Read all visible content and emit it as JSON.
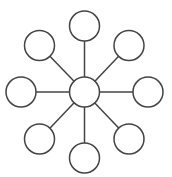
{
  "diagram": {
    "type": "hub-and-spoke",
    "stroke_color": "#444444",
    "fill_color": "#ffffff",
    "hub": {
      "id": "hub",
      "cx": 84.5,
      "cy": 92,
      "r": 15
    },
    "nodes": [
      {
        "id": "node-top",
        "cx": 84.5,
        "cy": 26,
        "r": 15
      },
      {
        "id": "node-top-right",
        "cx": 129,
        "cy": 45.5,
        "r": 15
      },
      {
        "id": "node-right",
        "cx": 148,
        "cy": 92,
        "r": 15
      },
      {
        "id": "node-bottom-right",
        "cx": 129,
        "cy": 139,
        "r": 15
      },
      {
        "id": "node-bottom",
        "cx": 84.5,
        "cy": 158,
        "r": 15
      },
      {
        "id": "node-bottom-left",
        "cx": 39.5,
        "cy": 139,
        "r": 15
      },
      {
        "id": "node-left",
        "cx": 21,
        "cy": 92,
        "r": 15
      },
      {
        "id": "node-top-left",
        "cx": 39.5,
        "cy": 45.5,
        "r": 15
      }
    ]
  }
}
